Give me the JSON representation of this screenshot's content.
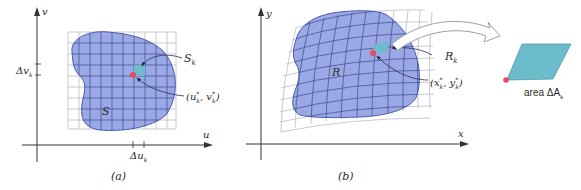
{
  "colors": {
    "region_fill": "#9aa8e6",
    "region_stroke": "#4a5cb0",
    "grid_line": "#b8bcc8",
    "grid_line_inside": "#3e4a8a",
    "cell_fill": "#6cbccb",
    "point": "#e84a5f",
    "axis": "#333333",
    "arrow_outline": "#a0a0a0"
  },
  "panel_a": {
    "caption": "(a)",
    "axis_u": "u",
    "axis_v": "v",
    "region_label": "S",
    "cell_label": "S",
    "cell_label_sub": "k",
    "point_label": "(u*k, v*k)",
    "point_label_parts": [
      "(u",
      "*",
      "k",
      ", v",
      "*",
      "k",
      ")"
    ],
    "delta_u": "Δu",
    "delta_u_sub": "k",
    "delta_v": "Δv",
    "delta_v_sub": "k"
  },
  "panel_b": {
    "caption": "(b)",
    "axis_x": "x",
    "axis_y": "y",
    "region_label": "R",
    "cell_label": "R",
    "cell_label_sub": "k",
    "point_label": "(x*k, y*k)",
    "point_label_parts": [
      "(x",
      "*",
      "k",
      ", y",
      "*",
      "k",
      ")"
    ]
  },
  "inset": {
    "label": "area ΔA",
    "label_prefix": "area ΔA",
    "label_sub": "k"
  }
}
